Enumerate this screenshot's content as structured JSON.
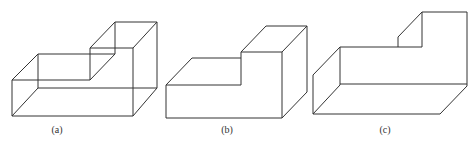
{
  "figures": [
    {
      "id": "a",
      "label": "(a)",
      "style": "wireframe-with-hidden-edges"
    },
    {
      "id": "b",
      "label": "(b)",
      "style": "solid-step-block"
    },
    {
      "id": "c",
      "label": "(c)",
      "style": "open-step-shell"
    }
  ],
  "colors": {
    "line": "#333333",
    "background": "#ffffff"
  }
}
